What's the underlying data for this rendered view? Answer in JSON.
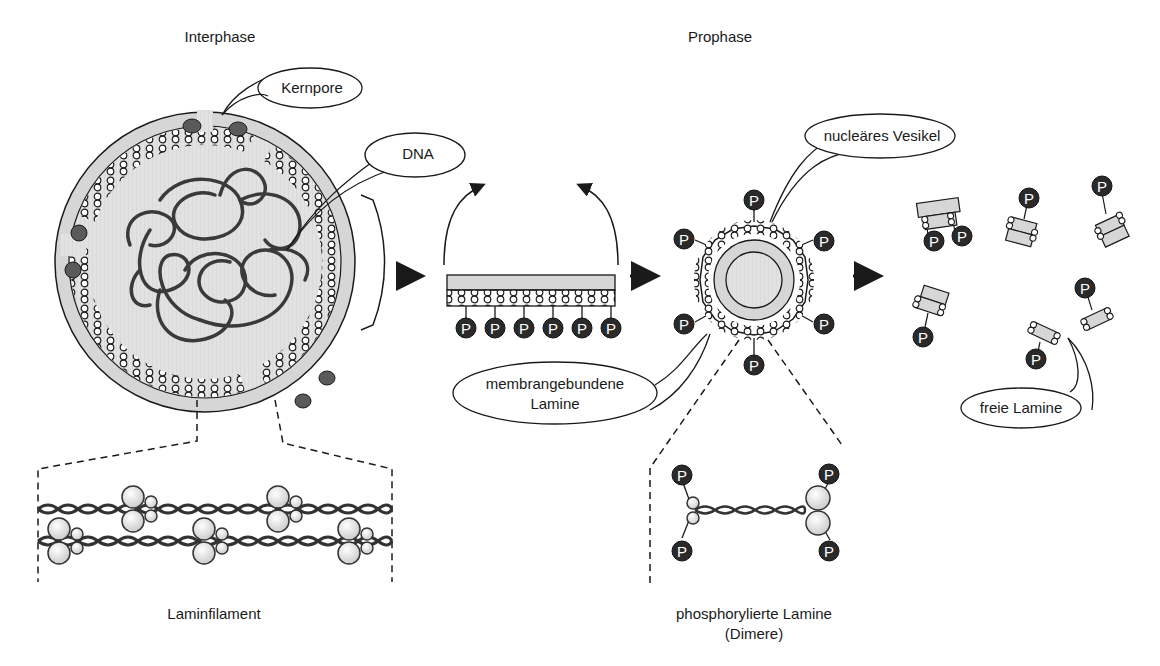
{
  "diagram": {
    "colors": {
      "membrane": "#d6d6d6",
      "nucleoplasm": "#e4e4e4",
      "outline": "#1a1a1a",
      "pore": "#5a5a5a",
      "dna": "#3a3a3a",
      "phosphate": "#2a2a2a",
      "phosphate_text": "#ffffff",
      "globule": "#e8e8e8"
    },
    "stages": {
      "interphase": "Interphase",
      "prophase": "Prophase"
    },
    "callouts": {
      "nuclear_pore": "Kernpore",
      "dna": "DNA",
      "nuclear_vesicle": "nucleäres Vesikel",
      "membrane_bound_lamins_line1": "membrangebundene",
      "membrane_bound_lamins_line2": "Lamine",
      "free_lamins": "freie Lamine"
    },
    "captions": {
      "lamin_filament": "Laminfilament",
      "phosphorylated_lamins_line1": "phosphorylierte Lamine",
      "phosphorylated_lamins_line2": "(Dimere)"
    },
    "phosphate_label": "P",
    "segment_phosphate_count": 6,
    "vesicle_phosphate_count": 6,
    "free_lamin_fragments": 6
  }
}
